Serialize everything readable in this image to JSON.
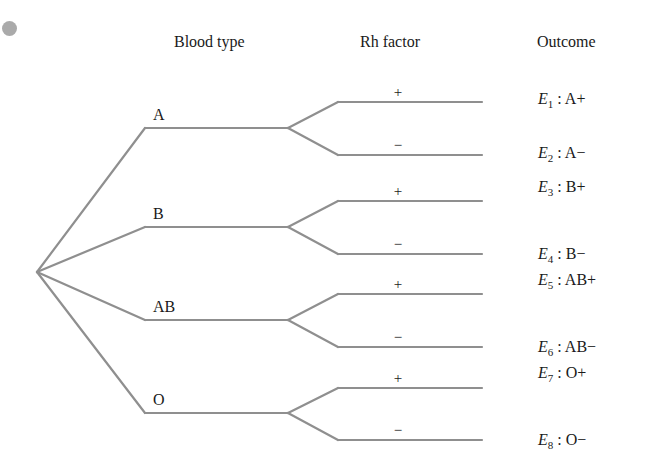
{
  "headers": {
    "blood_type": "Blood type",
    "rh_factor": "Rh factor",
    "outcome": "Outcome"
  },
  "colors": {
    "line": "#8f8f8f",
    "dot": "#aaaaaa",
    "text": "#1a1a1a"
  },
  "tree": {
    "root": {
      "x": 37,
      "y": 272
    },
    "blood_types": [
      {
        "label": "A",
        "y": 128,
        "rh": [
          {
            "sign": "+",
            "y": 102
          },
          {
            "sign": "−",
            "y": 155
          }
        ]
      },
      {
        "label": "B",
        "y": 227,
        "rh": [
          {
            "sign": "+",
            "y": 201
          },
          {
            "sign": "−",
            "y": 254
          }
        ]
      },
      {
        "label": "AB",
        "y": 320,
        "rh": [
          {
            "sign": "+",
            "y": 294
          },
          {
            "sign": "−",
            "y": 347
          }
        ]
      },
      {
        "label": "O",
        "y": 413,
        "rh": [
          {
            "sign": "+",
            "y": 388
          },
          {
            "sign": "−",
            "y": 440
          }
        ]
      }
    ]
  },
  "outcomes": [
    {
      "event": "E",
      "index": "1",
      "text": " : A+"
    },
    {
      "event": "E",
      "index": "2",
      "text": " : A−"
    },
    {
      "event": "E",
      "index": "3",
      "text": " : B+"
    },
    {
      "event": "E",
      "index": "4",
      "text": " : B−"
    },
    {
      "event": "E",
      "index": "5",
      "text": " : AB+"
    },
    {
      "event": "E",
      "index": "6",
      "text": " : AB−"
    },
    {
      "event": "E",
      "index": "7",
      "text": " : O+"
    },
    {
      "event": "E",
      "index": "8",
      "text": " : O−"
    }
  ]
}
